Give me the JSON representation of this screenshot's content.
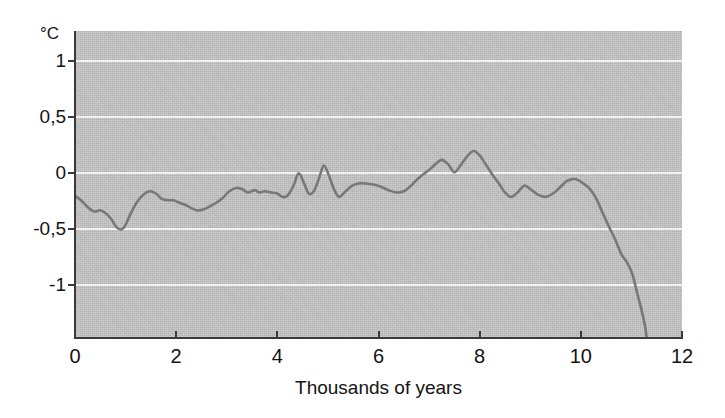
{
  "figure": {
    "name": "holocene-temperature-curve",
    "background_color": "#ffffff",
    "plot_background_color": "#c7c7c7",
    "gridline_color": "#ffffff",
    "axis_color": "#3a3a3a",
    "line_color": "#787878"
  },
  "chart_data": {
    "type": "line",
    "title": "",
    "subtitle": "",
    "xlabel": "Thousands of years",
    "ylabel": "",
    "unit_label": "°C",
    "xlim": [
      0,
      12
    ],
    "ylim": [
      -1.46,
      1.27
    ],
    "xticks": [
      0,
      2,
      4,
      6,
      8,
      10,
      12
    ],
    "xticklabels": [
      "0",
      "2",
      "4",
      "6",
      "8",
      "10",
      "12"
    ],
    "yticks": [
      1,
      0.5,
      0,
      -0.5,
      -1
    ],
    "yticklabels": [
      "1",
      "0,5",
      "0",
      "-0,5",
      "-1"
    ],
    "grid": true,
    "grid_axis": "y",
    "legend": "none",
    "decimal_separator": ",",
    "series": [
      {
        "name": "temperature-anomaly",
        "x": [
          0.0,
          0.12,
          0.25,
          0.38,
          0.5,
          0.62,
          0.72,
          0.82,
          0.92,
          1.0,
          1.1,
          1.22,
          1.35,
          1.48,
          1.6,
          1.72,
          1.85,
          1.95,
          2.05,
          2.18,
          2.3,
          2.42,
          2.55,
          2.68,
          2.8,
          2.92,
          3.05,
          3.18,
          3.3,
          3.42,
          3.55,
          3.65,
          3.75,
          3.88,
          4.0,
          4.1,
          4.2,
          4.32,
          4.42,
          4.52,
          4.62,
          4.72,
          4.82,
          4.92,
          5.02,
          5.12,
          5.22,
          5.35,
          5.48,
          5.6,
          5.75,
          5.9,
          6.05,
          6.2,
          6.35,
          6.5,
          6.62,
          6.75,
          6.88,
          7.0,
          7.12,
          7.25,
          7.38,
          7.5,
          7.62,
          7.75,
          7.88,
          8.0,
          8.12,
          8.25,
          8.38,
          8.5,
          8.62,
          8.75,
          8.88,
          9.0,
          9.15,
          9.3,
          9.45,
          9.6,
          9.72,
          9.85,
          9.95,
          10.05,
          10.18,
          10.3,
          10.42,
          10.55,
          10.68,
          10.8,
          10.92,
          11.02,
          11.12,
          11.2,
          11.26,
          11.3
        ],
        "y": [
          -0.2,
          -0.24,
          -0.3,
          -0.34,
          -0.33,
          -0.36,
          -0.41,
          -0.48,
          -0.5,
          -0.46,
          -0.36,
          -0.26,
          -0.19,
          -0.16,
          -0.18,
          -0.23,
          -0.24,
          -0.24,
          -0.26,
          -0.28,
          -0.31,
          -0.33,
          -0.32,
          -0.29,
          -0.26,
          -0.22,
          -0.16,
          -0.13,
          -0.14,
          -0.17,
          -0.15,
          -0.17,
          -0.16,
          -0.17,
          -0.18,
          -0.21,
          -0.2,
          -0.11,
          0.0,
          -0.08,
          -0.18,
          -0.16,
          -0.05,
          0.07,
          -0.02,
          -0.14,
          -0.21,
          -0.16,
          -0.11,
          -0.09,
          -0.09,
          -0.1,
          -0.12,
          -0.15,
          -0.17,
          -0.16,
          -0.12,
          -0.06,
          -0.01,
          0.03,
          0.08,
          0.12,
          0.08,
          0.01,
          0.07,
          0.15,
          0.2,
          0.16,
          0.08,
          -0.01,
          -0.09,
          -0.17,
          -0.21,
          -0.17,
          -0.11,
          -0.14,
          -0.19,
          -0.21,
          -0.18,
          -0.12,
          -0.07,
          -0.05,
          -0.06,
          -0.09,
          -0.14,
          -0.22,
          -0.34,
          -0.47,
          -0.59,
          -0.72,
          -0.8,
          -0.9,
          -1.08,
          -1.22,
          -1.34,
          -1.46
        ]
      }
    ]
  },
  "axes": {
    "x_ticks": [
      {
        "value": 0,
        "label": "0"
      },
      {
        "value": 2,
        "label": "2"
      },
      {
        "value": 4,
        "label": "4"
      },
      {
        "value": 6,
        "label": "6"
      },
      {
        "value": 8,
        "label": "8"
      },
      {
        "value": 10,
        "label": "10"
      },
      {
        "value": 12,
        "label": "12"
      }
    ],
    "y_ticks": [
      {
        "value": 1,
        "label": "1"
      },
      {
        "value": 0.5,
        "label": "0,5"
      },
      {
        "value": 0,
        "label": "0"
      },
      {
        "value": -0.5,
        "label": "-0,5"
      },
      {
        "value": -1,
        "label": "-1"
      }
    ],
    "x_axis_title": "Thousands of years",
    "y_unit": "°C"
  }
}
